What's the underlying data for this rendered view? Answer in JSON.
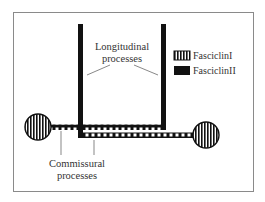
{
  "diagram": {
    "labels": {
      "longitudinal_line1": "Longitudinal",
      "longitudinal_line2": "processes",
      "commissural_line1": "Commissural",
      "commissural_line2": "processes"
    },
    "legend": {
      "items": [
        {
          "label": "FasciclinI",
          "pattern": "vertical-stripes"
        },
        {
          "label": "FasciclinII",
          "pattern": "solid-black"
        }
      ]
    },
    "colors": {
      "frame": "#8a8a8a",
      "ink": "#111111",
      "text": "#333333"
    }
  }
}
